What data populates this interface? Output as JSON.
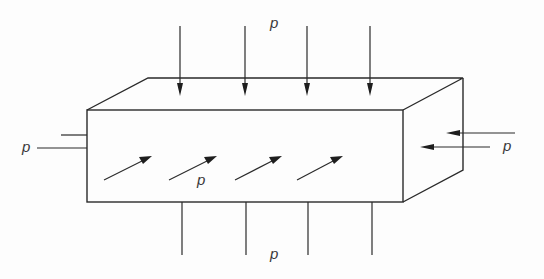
{
  "diagram": {
    "labels": {
      "top": "p",
      "bottom": "p",
      "left": "p",
      "right": "p",
      "front": "p"
    },
    "colors": {
      "line": "#2a2a2a",
      "arrowhead": "#1e1e1e",
      "label": "#3a3a3a",
      "background": "#fdfdfd"
    },
    "box": {
      "front_face": {
        "x1": 87,
        "y1": 110,
        "x2": 403,
        "y2": 202
      },
      "back_offset": {
        "dx": 61,
        "dy": -32
      }
    },
    "arrows": {
      "top_x": [
        180,
        245,
        307,
        370
      ],
      "bottom_x": [
        182,
        246,
        308,
        372
      ],
      "diagonal_count": 4,
      "right_count": 2,
      "left_lines": 2
    }
  }
}
